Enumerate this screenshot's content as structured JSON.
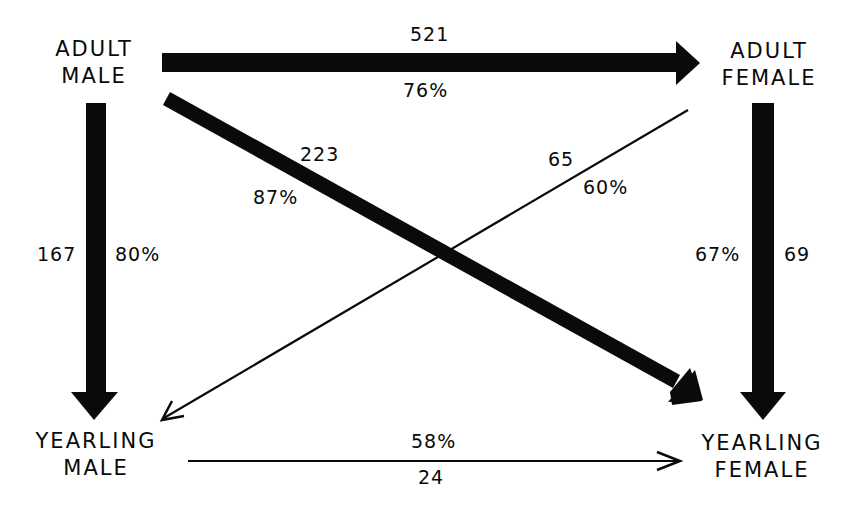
{
  "nodes": {
    "adult_male": {
      "line1": "ADULT",
      "line2": "MALE"
    },
    "adult_female": {
      "line1": "ADULT",
      "line2": "FEMALE"
    },
    "yearling_male": {
      "line1": "YEARLING",
      "line2": "MALE"
    },
    "yearling_female": {
      "line1": "YEARLING",
      "line2": "FEMALE"
    }
  },
  "edges": {
    "adult_male_to_adult_female": {
      "count": "521",
      "percent": "76%",
      "style": "thick"
    },
    "adult_male_to_yearling_female": {
      "count": "223",
      "percent": "87%",
      "style": "thick"
    },
    "adult_female_to_yearling_male": {
      "count": "65",
      "percent": "60%",
      "style": "thin"
    },
    "adult_male_to_yearling_male": {
      "count": "167",
      "percent": "80%",
      "style": "thick"
    },
    "adult_female_to_yearling_female": {
      "count": "69",
      "percent": "67%",
      "style": "thick"
    },
    "yearling_male_to_yearling_female": {
      "count": "24",
      "percent": "58%",
      "style": "thin"
    }
  },
  "colors": {
    "ink": "#0a0a0a",
    "background": "#ffffff"
  }
}
